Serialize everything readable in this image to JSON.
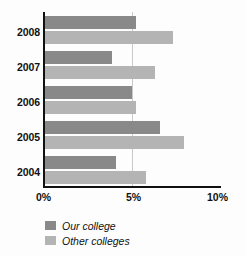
{
  "chart_data": {
    "type": "bar",
    "orientation": "horizontal",
    "title": "",
    "subtitle": "",
    "xlabel": "",
    "ylabel": "",
    "categories": [
      "2008",
      "2007",
      "2006",
      "2005",
      "2004"
    ],
    "series": [
      {
        "name": "Our college",
        "color": "#898989",
        "values": [
          5.2,
          3.9,
          5.0,
          6.6,
          4.1
        ]
      },
      {
        "name": "Other colleges",
        "color": "#b4b4b4",
        "values": [
          7.3,
          6.3,
          5.2,
          7.9,
          5.8
        ]
      }
    ],
    "xlim": [
      0,
      10
    ],
    "xticks": [
      0,
      5,
      10
    ],
    "xtick_labels": [
      "0%",
      "5%",
      "10%"
    ],
    "grid": true,
    "gridlines_at": [
      5
    ],
    "legend_position": "bottom-left",
    "value_unit": "%"
  },
  "legend": {
    "items": [
      {
        "label": "Our college",
        "color": "#898989"
      },
      {
        "label": "Other colleges",
        "color": "#b4b4b4"
      }
    ]
  },
  "axis": {
    "x_labels": [
      "0%",
      "5%",
      "10%"
    ],
    "y_labels": [
      "2008",
      "2007",
      "2006",
      "2005",
      "2004"
    ]
  },
  "colors": {
    "our_college": "#898989",
    "other_colleges": "#b4b4b4",
    "axis": "#111111",
    "gridline": "#c9c9c9",
    "background": "#fdfdfd"
  }
}
